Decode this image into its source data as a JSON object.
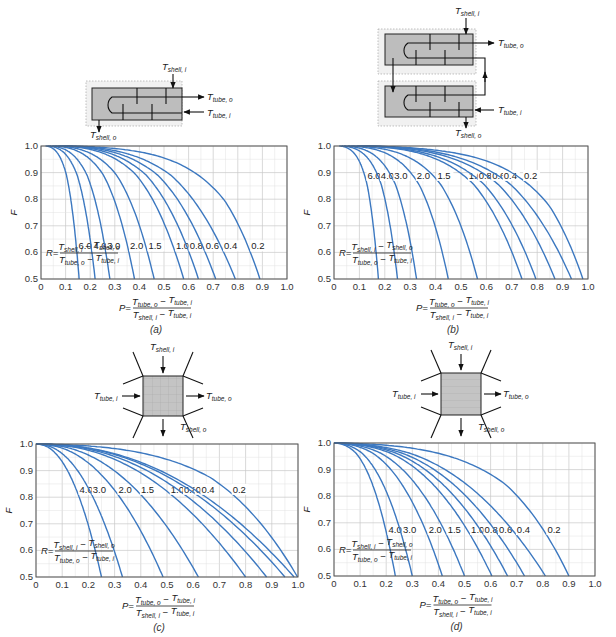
{
  "colors": {
    "curve": "#3c78c0",
    "grid": "#c9c9c9",
    "frame": "#555555",
    "shell_fill": "#bdbdbd"
  },
  "formulas": {
    "R_lhs": "R=",
    "R_num": [
      "T",
      "shell, i",
      " − ",
      "T",
      "shell, o"
    ],
    "R_den": [
      "T",
      "tube, o",
      " − ",
      "T",
      "tube, i"
    ],
    "P_lhs": "P=",
    "P_num": [
      "T",
      "tube, o",
      " − ",
      "T",
      "tube, i"
    ],
    "P_den": [
      "T",
      "shell, i",
      " − ",
      "T",
      "tube, i"
    ],
    "y_axis_label": "F"
  },
  "diagram_labels": {
    "T_shell_i": {
      "main": "T",
      "sub": "shell, i"
    },
    "T_shell_o": {
      "main": "T",
      "sub": "shell, o"
    },
    "T_tube_i": {
      "main": "T",
      "sub": "tube, i"
    },
    "T_tube_o": {
      "main": "T",
      "sub": "tube, o"
    }
  },
  "chart_data": [
    {
      "id": "a",
      "caption": "(a)",
      "description": "One shell pass and 2, 4, 6 ... tube passes",
      "type": "line",
      "xlabel": "P = (T_tube,o − T_tube,i)/(T_shell,i − T_tube,i)",
      "ylabel": "F",
      "xlim": [
        0,
        1.0
      ],
      "ylim": [
        0.5,
        1.0
      ],
      "xticks": [
        "0",
        "0.1",
        "0.2",
        "0.3",
        "0.4",
        "0.5",
        "0.6",
        "0.7",
        "0.8",
        "0.9",
        "1.0"
      ],
      "yticks": [
        "0.5",
        "0.6",
        "0.7",
        "0.8",
        "0.9",
        "1.0"
      ],
      "grid": true,
      "model": "1-2",
      "label_y": 0.615,
      "series": [
        {
          "name": "R=6.0",
          "label": "6.0",
          "P_at_F05": 0.155
        },
        {
          "name": "R=4.0",
          "label": "4.0",
          "P_at_F05": 0.22
        },
        {
          "name": "R=3.0",
          "label": "3.0",
          "P_at_F05": 0.28
        },
        {
          "name": "R=2.0",
          "label": "2.0",
          "P_at_F05": 0.38
        },
        {
          "name": "R=1.5",
          "label": "1.5",
          "P_at_F05": 0.46
        },
        {
          "name": "R=1.0",
          "label": "1.0",
          "P_at_F05": 0.58
        },
        {
          "name": "R=0.8",
          "label": "0.8",
          "P_at_F05": 0.64
        },
        {
          "name": "R=0.6",
          "label": "0.6",
          "P_at_F05": 0.71
        },
        {
          "name": "R=0.4",
          "label": "0.4",
          "P_at_F05": 0.79
        },
        {
          "name": "R=0.2",
          "label": "0.2",
          "P_at_F05": 0.89
        }
      ]
    },
    {
      "id": "b",
      "caption": "(b)",
      "description": "Two shell passes and 4, 8, 12 ... tube passes",
      "type": "line",
      "xlabel": "P = (T_tube,o − T_tube,i)/(T_shell,i − T_tube,i)",
      "ylabel": "F",
      "xlim": [
        0,
        1.0
      ],
      "ylim": [
        0.5,
        1.0
      ],
      "xticks": [
        "0",
        "0.1",
        "0.2",
        "0.3",
        "0.4",
        "0.5",
        "0.6",
        "0.7",
        "0.8",
        "0.9",
        "1.0"
      ],
      "yticks": [
        "0.5",
        "0.6",
        "0.7",
        "0.8",
        "0.9",
        "1.0"
      ],
      "grid": true,
      "model": "2-4",
      "label_y": 0.88,
      "series": [
        {
          "name": "R=6.0",
          "label": "6.0",
          "P_at_F05": 0.175
        },
        {
          "name": "R=4.0",
          "label": "4.0",
          "P_at_F05": 0.25
        },
        {
          "name": "R=3.0",
          "label": "3.0",
          "P_at_F05": 0.325
        },
        {
          "name": "R=2.0",
          "label": "2.0",
          "P_at_F05": 0.45
        },
        {
          "name": "R=1.5",
          "label": "1.5",
          "P_at_F05": 0.565
        },
        {
          "name": "R=1.0",
          "label": "1.0",
          "P_at_F05": 0.74
        },
        {
          "name": "R=0.8",
          "label": "0.8",
          "P_at_F05": 0.795
        },
        {
          "name": "R=0.6",
          "label": "0.6",
          "P_at_F05": 0.87
        },
        {
          "name": "R=0.4",
          "label": "0.4",
          "P_at_F05": 0.935
        },
        {
          "name": "R=0.2",
          "label": "0.2",
          "P_at_F05": 0.98
        }
      ]
    },
    {
      "id": "c",
      "caption": "(c)",
      "description": "Single-pass cross-flow with both fluids unmixed",
      "type": "line",
      "xlabel": "P = (T_tube,o − T_tube,i)/(T_shell,i − T_tube,i)",
      "ylabel": "F",
      "xlim": [
        0,
        1.0
      ],
      "ylim": [
        0.5,
        1.0
      ],
      "xticks": [
        "0",
        "0.1",
        "0.2",
        "0.3",
        "0.4",
        "0.5",
        "0.6",
        "0.7",
        "0.8",
        "0.9",
        "1.0"
      ],
      "yticks": [
        "0.5",
        "0.6",
        "0.7",
        "0.8",
        "0.9",
        "1.0"
      ],
      "grid": true,
      "model": "unmixed",
      "label_y": 0.82,
      "series": [
        {
          "name": "R=4.0",
          "label": "4.0",
          "P_at_F05": 0.25
        },
        {
          "name": "R=3.0",
          "label": "3.0",
          "P_at_F05": 0.33
        },
        {
          "name": "R=2.0",
          "label": "2.0",
          "P_at_F05": 0.485
        },
        {
          "name": "R=1.5",
          "label": "1.5",
          "P_at_F05": 0.62
        },
        {
          "name": "R=1.0",
          "label": "1.0",
          "P_at_F05": 0.8
        },
        {
          "name": "R=0.8",
          "label": "0.8",
          "P_at_F05": 0.88
        },
        {
          "name": "R=0.6",
          "label": "0.6",
          "P_at_F05": 0.95
        },
        {
          "name": "R=0.4",
          "label": "0.4",
          "P_at_F05": 0.985
        },
        {
          "name": "R=0.2",
          "label": "0.2",
          "P_at_F05": 0.998
        }
      ]
    },
    {
      "id": "d",
      "caption": "(d)",
      "description": "Single-pass cross-flow with one fluid mixed and the other unmixed",
      "type": "line",
      "xlabel": "P = (T_tube,o − T_tube,i)/(T_shell,i − T_tube,i)",
      "ylabel": "F",
      "xlim": [
        0,
        1.0
      ],
      "ylim": [
        0.5,
        1.0
      ],
      "xticks": [
        "0",
        "0.1",
        "0.2",
        "0.3",
        "0.4",
        "0.5",
        "0.6",
        "0.7",
        "0.8",
        "0.9",
        "1.0"
      ],
      "yticks": [
        "0.5",
        "0.6",
        "0.7",
        "0.8",
        "0.9",
        "1.0"
      ],
      "grid": true,
      "model": "mixed",
      "label_y": 0.665,
      "series": [
        {
          "name": "R=4.0",
          "label": "4.0",
          "P_at_F05": 0.235
        },
        {
          "name": "R=3.0",
          "label": "3.0",
          "P_at_F05": 0.3
        },
        {
          "name": "R=2.0",
          "label": "2.0",
          "P_at_F05": 0.415
        },
        {
          "name": "R=1.5",
          "label": "1.5",
          "P_at_F05": 0.5
        },
        {
          "name": "R=1.0",
          "label": "1.0",
          "P_at_F05": 0.605
        },
        {
          "name": "R=0.8",
          "label": "0.8",
          "P_at_F05": 0.665
        },
        {
          "name": "R=0.6",
          "label": "0.6",
          "P_at_F05": 0.73
        },
        {
          "name": "R=0.4",
          "label": "0.4",
          "P_at_F05": 0.81
        },
        {
          "name": "R=0.2",
          "label": "0.2",
          "P_at_F05": 0.9
        }
      ]
    }
  ]
}
